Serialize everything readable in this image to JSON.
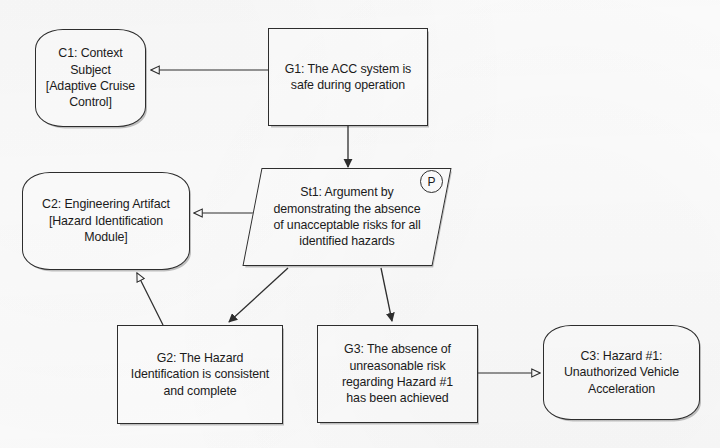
{
  "diagram": {
    "notation": "Goal Structuring Notation",
    "stroke_color": "#2e2e2e",
    "fill_color": "#fefefe",
    "background_color": "#fdfdfd"
  },
  "nodes": {
    "c1": {
      "id": "C1",
      "type": "context",
      "shape": "rounded-rectangle",
      "text": "C1: Context Subject\n[Adaptive Cruise Control]",
      "x": 35,
      "y": 29,
      "w": 111,
      "h": 98
    },
    "g1": {
      "id": "G1",
      "type": "goal",
      "shape": "rectangle",
      "text": "G1: The ACC system is\nsafe during operation",
      "x": 268,
      "y": 28,
      "w": 160,
      "h": 98
    },
    "c2": {
      "id": "C2",
      "type": "context",
      "shape": "rounded-rectangle",
      "text": "C2: Engineering Artifact\n[Hazard Identification\nModule]",
      "x": 22,
      "y": 172,
      "w": 168,
      "h": 98
    },
    "st1": {
      "id": "St1",
      "type": "strategy",
      "shape": "parallelogram",
      "text": "St1: Argument by\ndemonstrating the absence\nof unacceptable risks for all\nidentified hazards",
      "badge": "P",
      "x": 252,
      "y": 168,
      "w": 190,
      "h": 98
    },
    "g2": {
      "id": "G2",
      "type": "goal",
      "shape": "rectangle",
      "text": "G2: The Hazard\nIdentification is consistent\nand complete",
      "x": 117,
      "y": 325,
      "w": 166,
      "h": 99
    },
    "g3": {
      "id": "G3",
      "type": "goal",
      "shape": "rectangle",
      "text": "G3: The absence of\nunreasonable risk\nregarding Hazard #1\nhas been achieved",
      "x": 317,
      "y": 325,
      "w": 161,
      "h": 98
    },
    "c3": {
      "id": "C3",
      "type": "context",
      "shape": "rounded-rectangle",
      "text": "C3: Hazard #1:\nUnauthorized Vehicle\nAcceleration",
      "x": 543,
      "y": 325,
      "w": 157,
      "h": 95
    }
  },
  "links": [
    {
      "id": "g1-c1",
      "from": "G1",
      "to": "C1",
      "relation": "in-context-of",
      "arrowhead": "hollow"
    },
    {
      "id": "g1-st1",
      "from": "G1",
      "to": "St1",
      "relation": "supported-by",
      "arrowhead": "solid"
    },
    {
      "id": "st1-c2",
      "from": "St1",
      "to": "C2",
      "relation": "in-context-of",
      "arrowhead": "hollow"
    },
    {
      "id": "st1-g2",
      "from": "St1",
      "to": "G2",
      "relation": "supported-by",
      "arrowhead": "solid"
    },
    {
      "id": "st1-g3",
      "from": "St1",
      "to": "G3",
      "relation": "supported-by",
      "arrowhead": "solid"
    },
    {
      "id": "g2-c2",
      "from": "G2",
      "to": "C2",
      "relation": "in-context-of",
      "arrowhead": "hollow"
    },
    {
      "id": "g3-c3",
      "from": "G3",
      "to": "C3",
      "relation": "in-context-of",
      "arrowhead": "hollow"
    }
  ]
}
